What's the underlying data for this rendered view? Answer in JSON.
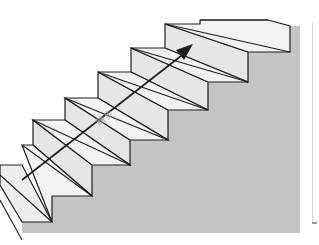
{
  "figure": {
    "type": "staircase-perspective-diagram",
    "arrow": {
      "direction": "up-right",
      "label": "踏步"
    },
    "colors": {
      "background": "#ffffff",
      "tread_fill": "#f1f1f1",
      "riser_fill": "#e6e6e6",
      "wall_fill": "#c4c4c4",
      "line": "#1e1e1e",
      "label": "#a8a8a8"
    },
    "steps_count": 7
  }
}
